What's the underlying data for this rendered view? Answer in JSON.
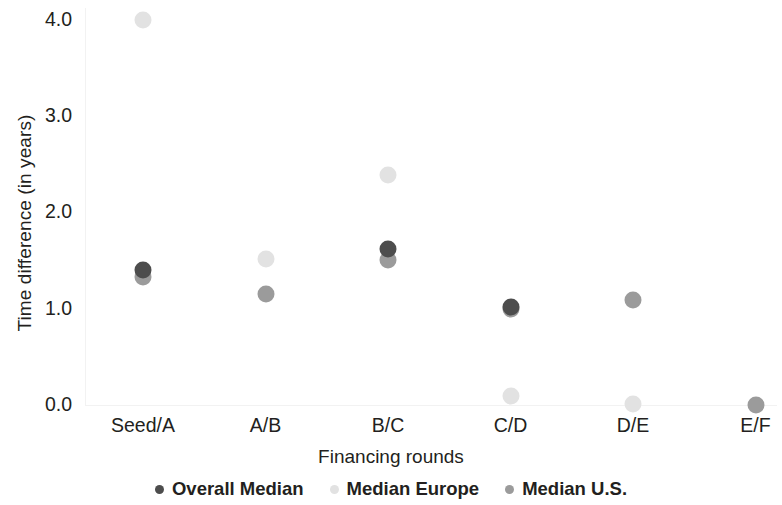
{
  "chart_data": {
    "type": "scatter",
    "title": "",
    "xlabel": "Financing rounds",
    "ylabel": "Time difference (in years)",
    "categories": [
      "Seed/A",
      "A/B",
      "B/C",
      "C/D",
      "D/E",
      "E/F"
    ],
    "ylim": [
      0.0,
      4.0
    ],
    "ytick_labels": [
      "0.0",
      "1.0",
      "2.0",
      "3.0",
      "4.0"
    ],
    "ytick_values": [
      0.0,
      1.0,
      2.0,
      3.0,
      4.0
    ],
    "grid": false,
    "legend_position": "bottom",
    "series": [
      {
        "name": "Overall Median",
        "color": "#4d4d4d",
        "values": [
          1.4,
          null,
          1.62,
          1.02,
          null,
          null
        ]
      },
      {
        "name": "Median Europe",
        "color": "#e2e2e2",
        "values": [
          4.0,
          1.52,
          2.39,
          0.09,
          0.01,
          null
        ]
      },
      {
        "name": "Median U.S.",
        "color": "#9b9b9b",
        "values": [
          1.33,
          1.15,
          1.51,
          1.0,
          1.09,
          0.0
        ]
      }
    ]
  },
  "legend": {
    "items": [
      {
        "label": "Overall Median",
        "color": "#4d4d4d"
      },
      {
        "label": "Median Europe",
        "color": "#e2e2e2"
      },
      {
        "label": "Median U.S.",
        "color": "#9b9b9b"
      }
    ]
  },
  "axes": {
    "y_title": "Time difference (in years)",
    "x_title": "Financing rounds"
  }
}
